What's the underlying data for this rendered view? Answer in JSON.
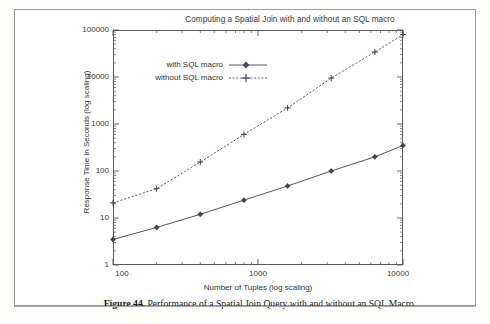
{
  "document": {
    "caption_prefix": "Figure 44.",
    "caption_text": " Performance of a Spatial Join Query with and without an SQL Macro."
  },
  "chart_data": {
    "type": "line",
    "title": "Computing a Spatial Join with and without an SQL macro",
    "xlabel": "Number of Tuples (log scaling)",
    "ylabel": "Response Time in Seconds (log scaling)",
    "xscale": "log",
    "yscale": "log",
    "xlim": [
      100,
      10000
    ],
    "ylim": [
      1,
      100000
    ],
    "xticks": [
      100,
      1000,
      10000
    ],
    "xtick_labels": [
      "100",
      "1000",
      "10000"
    ],
    "yticks": [
      1,
      10,
      100,
      1000,
      10000,
      100000
    ],
    "ytick_labels": [
      "1",
      "10",
      "100",
      "1000",
      "10000",
      "100000"
    ],
    "grid": false,
    "legend_position": "upper left",
    "x": [
      100,
      200,
      400,
      800,
      1600,
      3200,
      6400,
      10000
    ],
    "series": [
      {
        "name": "with SQL macro",
        "marker": "diamond",
        "linestyle": "solid",
        "color": "#4a4a5e",
        "values": [
          3.5,
          6.3,
          12,
          24,
          48,
          100,
          200,
          350
        ]
      },
      {
        "name": "without SQL macro",
        "marker": "plus",
        "linestyle": "dotted",
        "color": "#5a5a6e",
        "values": [
          21,
          42,
          155,
          600,
          2200,
          9500,
          34000,
          80000
        ]
      }
    ]
  }
}
